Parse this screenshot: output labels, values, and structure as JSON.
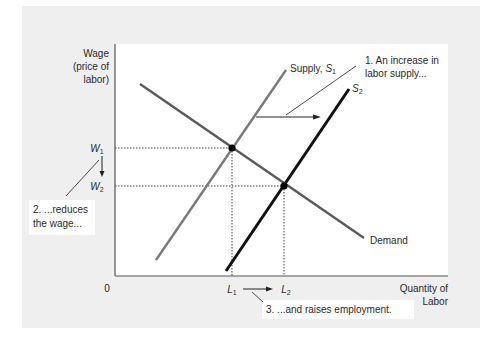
{
  "chart_data": {
    "type": "line",
    "title": "",
    "xlabel": "Quantity of Labor",
    "ylabel": "Wage (price of labor)",
    "xlabel_lines": [
      "Quantity of",
      "Labor"
    ],
    "ylabel_lines": [
      "Wage",
      "(price of",
      "labor)"
    ],
    "origin_label": "0",
    "grid": false,
    "legend": "none",
    "series": [
      {
        "name": "Demand",
        "label": "Demand",
        "color": "#5a5a5a",
        "width": 2.4,
        "points": [
          [
            140,
            84
          ],
          [
            364,
            238
          ]
        ]
      },
      {
        "name": "Supply, S1",
        "label_main": "Supply, ",
        "label_var": "S",
        "label_sub": "1",
        "color": "#7a7a7a",
        "width": 2.4,
        "points": [
          [
            156,
            260
          ],
          [
            286,
            70
          ]
        ]
      },
      {
        "name": "S2",
        "label_main": "",
        "label_var": "S",
        "label_sub": "2",
        "color": "#111111",
        "width": 3,
        "points": [
          [
            226,
            271
          ],
          [
            349,
            89
          ]
        ]
      }
    ],
    "equilibria": [
      {
        "name": "E1",
        "x": 232,
        "y": 148,
        "wage_label": "W",
        "wage_sub": "1",
        "qty_label": "L",
        "qty_sub": "1"
      },
      {
        "name": "E2",
        "x": 284,
        "y": 186,
        "wage_label": "W",
        "wage_sub": "2",
        "qty_label": "L",
        "qty_sub": "2"
      }
    ],
    "annotations": [
      {
        "id": "note1",
        "lines": [
          "1. An increase in",
          "labor supply..."
        ]
      },
      {
        "id": "note2",
        "lines": [
          "2. ...reduces",
          "the wage..."
        ]
      },
      {
        "id": "note3",
        "lines": [
          "3. ...and raises employment."
        ]
      }
    ]
  },
  "colors": {
    "frame_bg": "#efefef",
    "plot_bg": "#ffffff",
    "axis": "#555555",
    "text": "#2a2a2a"
  }
}
